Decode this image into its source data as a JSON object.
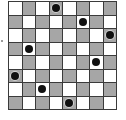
{
  "board": {
    "size": 8,
    "light_color": "#ffffff",
    "dark_color": "#bdbdbd",
    "line_color": "#3a3a3a",
    "piece_color": "#111111",
    "dark_rule": "(row+col) odd",
    "queens": [
      {
        "row": 0,
        "col": 3
      },
      {
        "row": 1,
        "col": 5
      },
      {
        "row": 2,
        "col": 7
      },
      {
        "row": 3,
        "col": 1
      },
      {
        "row": 4,
        "col": 6
      },
      {
        "row": 5,
        "col": 0
      },
      {
        "row": 6,
        "col": 2
      },
      {
        "row": 7,
        "col": 4
      }
    ],
    "piece_icon": "filled-circle-icon"
  }
}
